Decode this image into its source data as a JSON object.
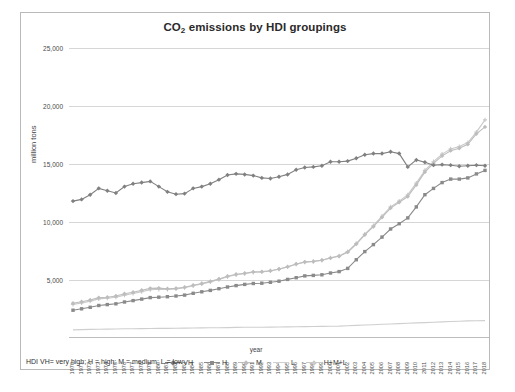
{
  "figure": {
    "caption": ""
  },
  "chart": {
    "title": "CO2 emissions by HDI groupings",
    "title_main": "CO",
    "title_sub": "2",
    "title_rest": " emissions by HDI groupings",
    "note": "HDI VH= very high; H = high; M = medium; L = low",
    "xlabel": "year",
    "ylabel": "million tons"
  },
  "colors": {
    "vh": "#808080",
    "h": "#8a8a8a",
    "m": "#bdbdbd",
    "l": "#cfcfcf",
    "hml": "#c9c9c9",
    "grid": "#d6d6d6",
    "frame": "#b9b9b9",
    "text": "#3a3a3a"
  },
  "chart_data": {
    "type": "line",
    "title": "CO2 emissions by HDI groupings",
    "xlabel": "year",
    "ylabel": "million tons",
    "ylim": [
      0,
      25000
    ],
    "yticks": [
      "5,000",
      "10,000",
      "15,000",
      "20,000",
      "25,000"
    ],
    "ytick_values": [
      5000,
      10000,
      15000,
      20000,
      25000
    ],
    "grid": true,
    "legend_position": "bottom",
    "x": [
      1970,
      1971,
      1972,
      1973,
      1974,
      1975,
      1976,
      1977,
      1978,
      1979,
      1980,
      1981,
      1982,
      1983,
      1984,
      1985,
      1986,
      1987,
      1988,
      1989,
      1990,
      1991,
      1992,
      1993,
      1994,
      1995,
      1996,
      1997,
      1998,
      1999,
      2000,
      2001,
      2002,
      2003,
      2004,
      2005,
      2006,
      2007,
      2008,
      2009,
      2010,
      2011,
      2012,
      2013,
      2014,
      2015,
      2016,
      2017,
      2018
    ],
    "series": [
      {
        "name": "VH",
        "marker": "diamond",
        "color": "#808080",
        "values": [
          11800,
          11950,
          12350,
          12900,
          12700,
          12500,
          13050,
          13300,
          13400,
          13500,
          13050,
          12600,
          12400,
          12450,
          12900,
          13050,
          13300,
          13650,
          14050,
          14150,
          14100,
          14000,
          13800,
          13750,
          13900,
          14100,
          14500,
          14700,
          14750,
          14850,
          15200,
          15200,
          15250,
          15500,
          15800,
          15900,
          15900,
          16050,
          15900,
          14750,
          15350,
          15150,
          14900,
          14950,
          14900,
          14800,
          14850,
          14900,
          14850
        ]
      },
      {
        "name": "H",
        "marker": "square",
        "color": "#8a8a8a",
        "values": [
          2400,
          2520,
          2650,
          2800,
          2880,
          2950,
          3100,
          3220,
          3350,
          3480,
          3520,
          3560,
          3620,
          3700,
          3850,
          3980,
          4100,
          4250,
          4400,
          4520,
          4620,
          4700,
          4720,
          4800,
          4900,
          5050,
          5200,
          5350,
          5400,
          5450,
          5600,
          5720,
          6000,
          6750,
          7450,
          8050,
          8700,
          9400,
          9850,
          10350,
          11300,
          12350,
          12900,
          13400,
          13700,
          13700,
          13800,
          14150,
          14450
        ]
      },
      {
        "name": "M",
        "marker": "diamond",
        "color": "#bdbdbd",
        "values": [
          3000,
          3120,
          3280,
          3480,
          3520,
          3620,
          3820,
          3950,
          4120,
          4280,
          4300,
          4250,
          4280,
          4380,
          4550,
          4700,
          4880,
          5080,
          5320,
          5500,
          5580,
          5700,
          5720,
          5800,
          5950,
          6150,
          6380,
          6550,
          6600,
          6700,
          6900,
          7050,
          7400,
          8100,
          8900,
          9600,
          10400,
          11200,
          11700,
          12200,
          13200,
          14300,
          15050,
          15700,
          16150,
          16350,
          16700,
          17600,
          18200
        ]
      },
      {
        "name": "L",
        "marker": "line",
        "color": "#cfcfcf",
        "values": [
          700,
          720,
          740,
          760,
          770,
          780,
          790,
          800,
          810,
          820,
          830,
          830,
          840,
          850,
          860,
          870,
          880,
          890,
          900,
          910,
          920,
          930,
          930,
          940,
          950,
          960,
          970,
          980,
          990,
          1000,
          1010,
          1030,
          1060,
          1090,
          1120,
          1150,
          1180,
          1210,
          1240,
          1270,
          1300,
          1330,
          1360,
          1390,
          1420,
          1450,
          1470,
          1490,
          1500
        ]
      },
      {
        "name": "H+M+L",
        "marker": "plus",
        "color": "#c9c9c9",
        "values": [
          2900,
          3020,
          3180,
          3370,
          3430,
          3520,
          3700,
          3840,
          4000,
          4160,
          4200,
          4180,
          4230,
          4330,
          4500,
          4660,
          4840,
          5040,
          5280,
          5450,
          5540,
          5660,
          5690,
          5780,
          5930,
          6120,
          6360,
          6540,
          6600,
          6710,
          6920,
          7080,
          7450,
          8150,
          8950,
          9680,
          10500,
          11300,
          11800,
          12350,
          13350,
          14450,
          15200,
          15850,
          16300,
          16500,
          16850,
          17750,
          18800
        ]
      }
    ],
    "legend": [
      "VH",
      "H",
      "M",
      "L",
      "H+M+L"
    ]
  }
}
